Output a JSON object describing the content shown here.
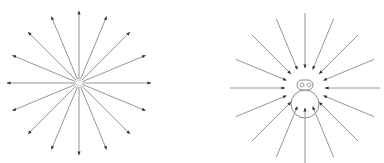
{
  "colors": {
    "background": "#ffffff",
    "arrow": "#7a7a7a",
    "arrowhead": "#333333",
    "figure_stroke": "#8a8a8a"
  },
  "diagrams": [
    {
      "id": "outward",
      "description": "16 arrows radiating outward from a central point",
      "center": [
        79,
        83
      ],
      "arrow_count": 16,
      "inner_radius": 4,
      "outer_radius": 72,
      "direction": "outward"
    },
    {
      "id": "inward",
      "description": "16 arrows pointing inward toward a small figure (body circle with head containing two eyes)",
      "center": [
        305,
        88
      ],
      "arrow_count": 16,
      "outer_radius": 75,
      "inner_radius": 20,
      "direction": "inward",
      "figure": {
        "body": {
          "cx": 305,
          "cy": 104,
          "r": 14
        },
        "head": {
          "x": 297,
          "y": 80,
          "w": 16,
          "h": 10,
          "rx": 5
        },
        "eyes": [
          {
            "cx": 302,
            "cy": 85,
            "r": 2
          },
          {
            "cx": 309,
            "cy": 85,
            "r": 2
          }
        ]
      }
    }
  ]
}
